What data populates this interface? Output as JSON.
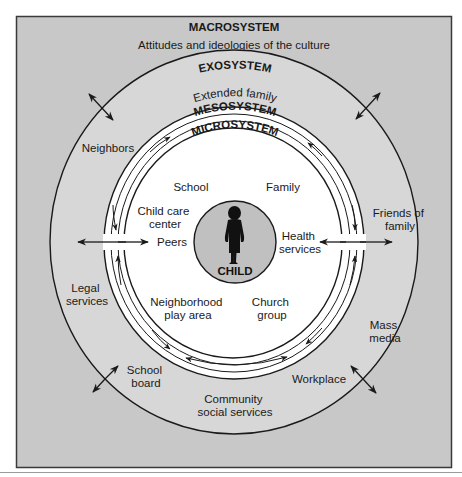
{
  "diagram": {
    "colors": {
      "macro_fill": "#c8c8c8",
      "exo_fill": "#d7d7d7",
      "meso_fill": "#ffffff",
      "child_fill": "#c0c0c0",
      "line": "#1a1a1a"
    },
    "macrosystem": {
      "heading": "MACROSYSTEM",
      "subtitle": "Attitudes and ideologies of the culture"
    },
    "exosystem": {
      "heading": "EXOSYSTEM",
      "items": {
        "extended_family": "Extended family",
        "neighbors": "Neighbors",
        "friends_line1": "Friends of",
        "friends_line2": "family",
        "legal_line1": "Legal",
        "legal_line2": "services",
        "mass_line1": "Mass",
        "mass_line2": "media",
        "school_board_line1": "School",
        "school_board_line2": "board",
        "workplace": "Workplace",
        "community_line1": "Community",
        "community_line2": "social services"
      }
    },
    "mesosystem": {
      "heading": "MESOSYSTEM"
    },
    "microsystem": {
      "heading": "MICROSYSTEM",
      "items": {
        "school": "School",
        "family": "Family",
        "childcare_line1": "Child care",
        "childcare_line2": "center",
        "peers": "Peers",
        "health_line1": "Health",
        "health_line2": "services",
        "neighborhood_line1": "Neighborhood",
        "neighborhood_line2": "play area",
        "church_line1": "Church",
        "church_line2": "group"
      }
    },
    "center": {
      "label": "CHILD",
      "icon": "child-silhouette-icon"
    }
  }
}
